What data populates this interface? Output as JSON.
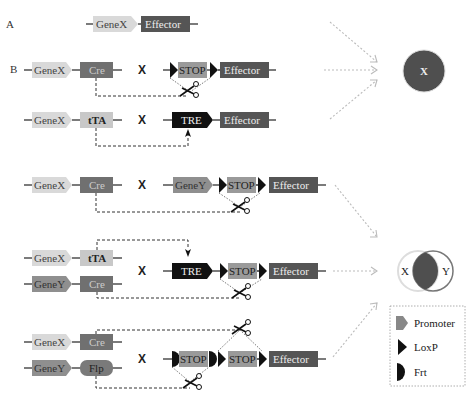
{
  "colors": {
    "promoter_x": "#d9d9d9",
    "promoter_y": "#8f8f8f",
    "cre": "#707070",
    "tta": "#c8c8c8",
    "flp": "#7a7a7a",
    "stop": "#9a9a9a",
    "effector": "#555555",
    "tre": "#111111",
    "outcome_circle": "#4f4f4f",
    "arrow": "#bbbbbb"
  },
  "sections": {
    "a": "A",
    "b": "B"
  },
  "cross_symbol": "X",
  "labels": {
    "genex": "GeneX",
    "geney": "GeneY",
    "cre": "Cre",
    "tta": "tTA",
    "flp": "Flp",
    "stop": "STOP",
    "tre": "TRE",
    "effector": "Effector"
  },
  "outcomes": {
    "single": "X",
    "intersect_left": "X",
    "intersect_right": "Y"
  },
  "legend": {
    "items": [
      {
        "icon": "promoter-icon",
        "label": "Promoter"
      },
      {
        "icon": "loxp-icon",
        "label": "LoxP"
      },
      {
        "icon": "frt-icon",
        "label": "Frt"
      }
    ]
  }
}
